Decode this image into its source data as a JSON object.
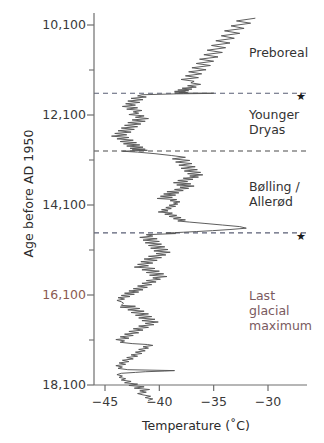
{
  "chart_data": {
    "type": "line",
    "title": "",
    "xlabel": "Temperature  (˚C)",
    "ylabel": "Age before AD 1950",
    "xlim": [
      -46.5,
      -28.0
    ],
    "ylim": [
      18900,
      9500
    ],
    "y_axis_inverted": true,
    "grid": false,
    "legend": "none",
    "xticks": [
      -45,
      -40,
      -35,
      -30
    ],
    "xtick_labels": [
      "−45",
      "−40",
      "−35",
      "−30"
    ],
    "yticks": [
      10100,
      12100,
      14100,
      16100,
      18100
    ],
    "ytick_labels": [
      "10,100",
      "12,100",
      "14,100",
      "16,100",
      "18,100"
    ],
    "y_minor_ticks": [
      11100,
      13100,
      15100,
      17100
    ],
    "series": [
      {
        "name": "Greenland ice-core temperature reconstruction",
        "color": "#555555",
        "x": [
          -31.2,
          -32.9,
          -31.6,
          -33.4,
          -32.2,
          -34.0,
          -32.6,
          -34.3,
          -33.1,
          -34.8,
          -33.5,
          -35.2,
          -33.9,
          -35.6,
          -34.2,
          -35.9,
          -34.6,
          -36.3,
          -35.0,
          -36.6,
          -35.3,
          -37.0,
          -35.7,
          -37.3,
          -36.1,
          -37.6,
          -36.4,
          -38.0,
          -36.8,
          -37.1,
          -36.2,
          -37.4,
          -36.6,
          -37.9,
          -37.0,
          -38.3,
          -37.3,
          -38.6,
          -37.6,
          -38.0,
          -37.4,
          -38.2,
          -37.8,
          -38.6,
          -38.1,
          -35.0,
          -35.1,
          -38.4,
          -41.6,
          -42.0,
          -41.2,
          -42.6,
          -41.5,
          -42.9,
          -41.8,
          -43.1,
          -42.2,
          -43.4,
          -42.0,
          -43.0,
          -41.6,
          -42.4,
          -41.9,
          -42.8,
          -41.4,
          -42.2,
          -41.0,
          -42.5,
          -41.3,
          -42.9,
          -41.7,
          -43.2,
          -42.0,
          -43.5,
          -42.3,
          -43.8,
          -42.6,
          -44.1,
          -43.0,
          -44.4,
          -42.8,
          -43.9,
          -42.4,
          -43.6,
          -42.1,
          -43.3,
          -41.8,
          -43.0,
          -41.5,
          -42.7,
          -41.3,
          -42.5,
          -41.1,
          -42.3,
          -43.4,
          -42.0,
          -40.4,
          -38.9,
          -37.6,
          -38.8,
          -37.2,
          -38.5,
          -37.0,
          -38.2,
          -36.7,
          -38.0,
          -36.5,
          -37.7,
          -36.2,
          -37.4,
          -36.0,
          -37.2,
          -36.4,
          -37.8,
          -36.9,
          -38.3,
          -37.4,
          -38.7,
          -37.1,
          -38.4,
          -36.8,
          -38.1,
          -37.3,
          -38.6,
          -37.8,
          -39.3,
          -38.2,
          -39.6,
          -38.5,
          -39.9,
          -38.8,
          -40.2,
          -38.4,
          -39.0,
          -38.1,
          -38.7,
          -38.3,
          -39.1,
          -38.5,
          -39.4,
          -38.9,
          -39.8,
          -39.2,
          -40.1,
          -38.8,
          -39.5,
          -38.4,
          -39.1,
          -38.0,
          -38.7,
          -37.6,
          -38.3,
          -37.2,
          -35.8,
          -34.2,
          -32.6,
          -32.0,
          -33.5,
          -35.1,
          -36.6,
          -37.8,
          -38.6,
          -39.4,
          -38.5,
          -41.2,
          -40.6,
          -41.8,
          -40.2,
          -41.5,
          -40.0,
          -41.3,
          -39.8,
          -41.0,
          -39.5,
          -40.8,
          -39.2,
          -40.5,
          -39.0,
          -40.3,
          -39.4,
          -41.0,
          -39.8,
          -41.4,
          -40.2,
          -41.7,
          -40.6,
          -42.0,
          -41.0,
          -42.3,
          -40.4,
          -41.6,
          -40.0,
          -41.2,
          -39.6,
          -40.9,
          -39.3,
          -40.6,
          -39.9,
          -41.2,
          -40.3,
          -41.6,
          -40.7,
          -42.0,
          -41.1,
          -42.4,
          -41.5,
          -42.8,
          -41.9,
          -43.2,
          -42.3,
          -43.5,
          -42.7,
          -43.8,
          -43.2,
          -43.9,
          -43.5,
          -43.3,
          -43.4,
          -43.5,
          -42.2,
          -43.6,
          -41.8,
          -42.9,
          -41.4,
          -42.6,
          -41.0,
          -42.2,
          -40.7,
          -41.9,
          -40.4,
          -41.6,
          -40.1,
          -41.3,
          -40.5,
          -41.9,
          -41.0,
          -42.4,
          -41.5,
          -42.8,
          -41.9,
          -43.2,
          -42.4,
          -43.6,
          -42.8,
          -44.0,
          -43.2,
          -43.6,
          -42.5,
          -41.1,
          -40.6,
          -41.5,
          -41.0,
          -41.9,
          -41.3,
          -42.2,
          -41.6,
          -42.6,
          -42.0,
          -43.0,
          -42.4,
          -43.4,
          -42.8,
          -43.7,
          -43.1,
          -44.0,
          -43.4,
          -43.8,
          -42.9,
          -38.6,
          -39.5,
          -41.3,
          -42.2,
          -43.5,
          -43.9,
          -43.4,
          -43.7,
          -43.1,
          -43.5,
          -42.6,
          -43.2,
          -42.0,
          -42.8,
          -41.4,
          -42.3,
          -40.9,
          -41.8,
          -41.2,
          -42.0,
          -41.5,
          -40.8,
          -41.3,
          -40.6,
          -41.0
        ],
        "y": [
          9950,
          10010,
          10060,
          10120,
          10175,
          10230,
          10285,
          10340,
          10395,
          10450,
          10500,
          10555,
          10605,
          10660,
          10710,
          10760,
          10810,
          10860,
          10905,
          10955,
          11000,
          11050,
          11095,
          11140,
          11185,
          11230,
          11270,
          11310,
          11350,
          11385,
          11420,
          11450,
          11480,
          11505,
          11525,
          11545,
          11560,
          11575,
          11585,
          11595,
          11600,
          11605,
          11608,
          11610,
          11613,
          11615,
          11620,
          11630,
          11650,
          11675,
          11700,
          11730,
          11760,
          11790,
          11820,
          11850,
          11880,
          11910,
          11940,
          11970,
          12000,
          12030,
          12060,
          12090,
          12120,
          12150,
          12180,
          12210,
          12240,
          12270,
          12300,
          12330,
          12360,
          12390,
          12420,
          12450,
          12480,
          12510,
          12540,
          12570,
          12600,
          12630,
          12660,
          12690,
          12715,
          12740,
          12765,
          12790,
          12815,
          12840,
          12860,
          12875,
          12885,
          12895,
          12905,
          12925,
          12960,
          13000,
          13040,
          13075,
          13110,
          13145,
          13180,
          13215,
          13250,
          13285,
          13315,
          13345,
          13375,
          13405,
          13430,
          13455,
          13480,
          13505,
          13530,
          13555,
          13580,
          13605,
          13630,
          13655,
          13680,
          13705,
          13730,
          13755,
          13780,
          13805,
          13830,
          13855,
          13880,
          13905,
          13930,
          13955,
          13980,
          14005,
          14030,
          14055,
          14080,
          14105,
          14130,
          14155,
          14180,
          14205,
          14230,
          14255,
          14280,
          14305,
          14330,
          14355,
          14380,
          14405,
          14430,
          14455,
          14480,
          14510,
          14545,
          14580,
          14615,
          14645,
          14670,
          14690,
          14705,
          14715,
          14725,
          14735,
          14760,
          14790,
          14820,
          14850,
          14880,
          14910,
          14940,
          14970,
          15000,
          15030,
          15060,
          15090,
          15120,
          15150,
          15180,
          15210,
          15240,
          15270,
          15300,
          15330,
          15360,
          15390,
          15420,
          15450,
          15480,
          15510,
          15540,
          15570,
          15600,
          15630,
          15660,
          15690,
          15720,
          15750,
          15780,
          15810,
          15840,
          15870,
          15900,
          15930,
          15960,
          15985,
          16010,
          16035,
          16060,
          16085,
          16110,
          16135,
          16160,
          16190,
          16220,
          16250,
          16280,
          16305,
          16330,
          16350,
          16370,
          16400,
          16430,
          16460,
          16490,
          16520,
          16550,
          16580,
          16610,
          16640,
          16670,
          16700,
          16730,
          16760,
          16790,
          16820,
          16850,
          16880,
          16910,
          16940,
          16970,
          17000,
          17030,
          17060,
          17090,
          17120,
          17150,
          17180,
          17200,
          17220,
          17250,
          17280,
          17310,
          17340,
          17370,
          17400,
          17430,
          17460,
          17490,
          17520,
          17550,
          17580,
          17610,
          17640,
          17670,
          17700,
          17730,
          17760,
          17780,
          17790,
          17805,
          17820,
          17840,
          17870,
          17900,
          17930,
          17960,
          17990,
          18020,
          18050,
          18080,
          18110,
          18140,
          18170,
          18200,
          18230,
          18260,
          18290,
          18320,
          18350,
          18380,
          18410,
          18440
        ]
      }
    ],
    "event_horizons": [
      {
        "label": "",
        "age": 11615,
        "style": "dashed",
        "color": "#5a5f75",
        "marker": "star"
      },
      {
        "label": "",
        "age": 12900,
        "style": "dashed",
        "color": "#4a4a4a",
        "marker": "none"
      },
      {
        "label": "",
        "age": 14720,
        "style": "dashed",
        "color": "#5a5f75",
        "marker": "star"
      }
    ],
    "annotations": [
      {
        "text": "Preboreal",
        "age_center": 10700,
        "color": "#333333"
      },
      {
        "text": "Younger\nDryas",
        "age_center": 12250,
        "color": "#333333"
      },
      {
        "text": "Bølling /\nAllerød",
        "age_center": 13850,
        "color": "#333333"
      },
      {
        "text": "Last\nglacial\nmaximum",
        "age_center": 16450,
        "color": "#7a5a60"
      }
    ]
  },
  "axes": {
    "y_label": "Age before AD 1950",
    "x_label": "Temperature  (˚C)"
  },
  "colors": {
    "curve": "#555555",
    "axis": "#6e6e6e",
    "tick_text": "#3a3a3a",
    "annotation": "#333333",
    "annotation_warm": "#7a5a60",
    "horizon_blue": "#5a5f75",
    "horizon_gray": "#4a4a4a",
    "star": "#1a1a1a"
  },
  "markers": {
    "star_glyph": "★"
  }
}
